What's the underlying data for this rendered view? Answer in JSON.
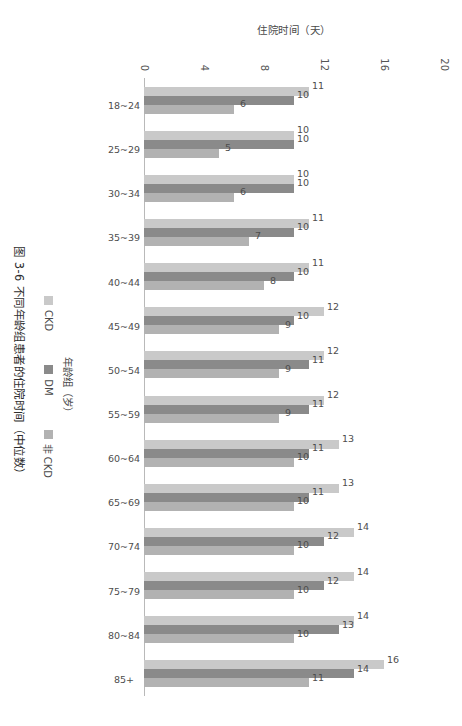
{
  "caption": "图 3-6  不同年龄组患者的住院时间（中位数）",
  "legend": {
    "items": [
      {
        "label": "CKD",
        "color": "#c9c9c9"
      },
      {
        "label": "DM",
        "color": "#8a8a8a"
      },
      {
        "label": "非 CKD",
        "color": "#b2b2b2"
      }
    ]
  },
  "chart_data": {
    "type": "bar",
    "title": "图 3-6  不同年龄组患者的住院时间（中位数）",
    "xlabel": "年龄组（岁）",
    "ylabel": "住院时间（天）",
    "ylim": [
      0,
      20
    ],
    "yticks": [
      0,
      4,
      8,
      12,
      16,
      20
    ],
    "grid": false,
    "legend_position": "bottom",
    "categories": [
      "18~24",
      "25~29",
      "30~34",
      "35~39",
      "40~44",
      "45~49",
      "50~54",
      "55~59",
      "60~64",
      "65~69",
      "70~74",
      "75~79",
      "80~84",
      "85+"
    ],
    "series": [
      {
        "name": "CKD",
        "color": "#c9c9c9",
        "values": [
          11,
          10,
          10,
          11,
          11,
          12,
          12,
          12,
          13,
          13,
          14,
          14,
          14,
          16
        ]
      },
      {
        "name": "DM",
        "color": "#8a8a8a",
        "values": [
          10,
          10,
          10,
          10,
          10,
          10,
          11,
          11,
          11,
          11,
          12,
          12,
          13,
          14
        ]
      },
      {
        "name": "非 CKD",
        "color": "#b2b2b2",
        "values": [
          6,
          5,
          6,
          7,
          8,
          9,
          9,
          9,
          10,
          10,
          10,
          10,
          10,
          11
        ]
      }
    ]
  }
}
